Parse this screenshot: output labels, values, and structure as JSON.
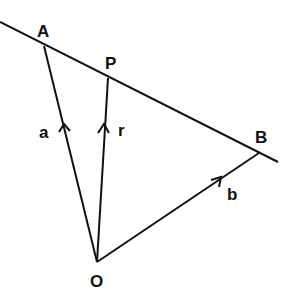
{
  "diagram": {
    "type": "vector-line-diagram",
    "colors": {
      "stroke": "#111111",
      "text": "#111111",
      "background": "#ffffff"
    },
    "points": {
      "O": {
        "label": "O",
        "x": 97,
        "y": 262
      },
      "A": {
        "label": "A",
        "x": 44,
        "y": 46
      },
      "P": {
        "label": "P",
        "x": 108,
        "y": 78
      },
      "B": {
        "label": "B",
        "x": 259,
        "y": 153
      }
    },
    "vectors": [
      {
        "name": "a",
        "label": "a",
        "from": "O",
        "to": "A"
      },
      {
        "name": "r",
        "label": "r",
        "from": "O",
        "to": "P"
      },
      {
        "name": "b",
        "label": "b",
        "from": "O",
        "to": "B"
      }
    ],
    "line": {
      "through": [
        "A",
        "P",
        "B"
      ],
      "start": {
        "x": 0,
        "y": 22
      },
      "end": {
        "x": 278,
        "y": 162
      }
    }
  }
}
